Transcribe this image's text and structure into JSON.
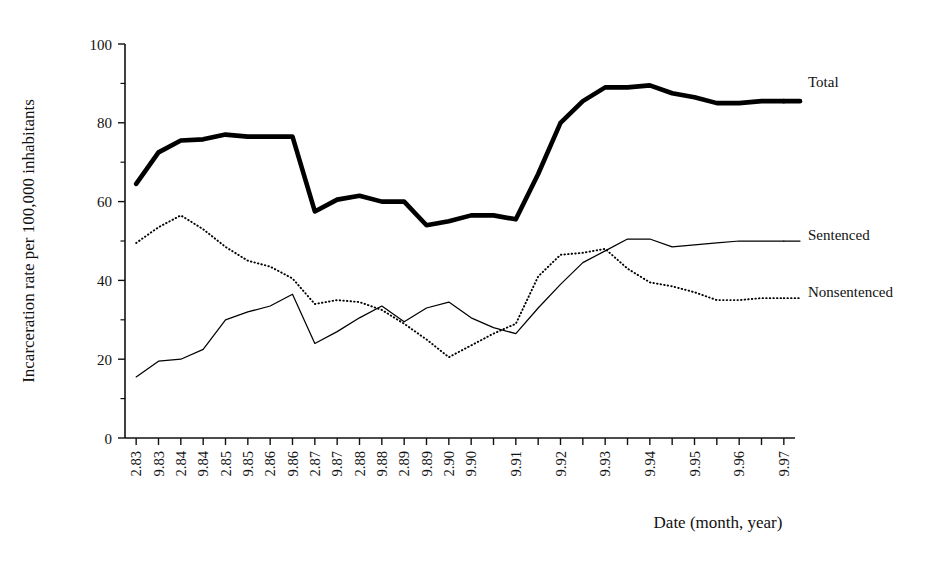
{
  "chart_data": {
    "type": "line",
    "title": "",
    "xlabel": "Date (month, year)",
    "ylabel": "Incarceration rate per 100,000 inhabitants",
    "ylim": [
      0,
      100
    ],
    "yticks": [
      0,
      20,
      40,
      60,
      80,
      100
    ],
    "yticks_minor": [
      10,
      30,
      50,
      70,
      90
    ],
    "grid": false,
    "legend_position": "right-inline",
    "categories": [
      "2.83",
      "9.83",
      "2.84",
      "9.84",
      "2.85",
      "9.85",
      "2.86",
      "9.86",
      "2.87",
      "9.87",
      "2.88",
      "9.88",
      "2.89",
      "9.89",
      "2.90",
      "9.90",
      "2.91",
      "9.91",
      "2.92",
      "9.92",
      "2.93",
      "9.93",
      "2.94",
      "9.94",
      "2.95",
      "9.95",
      "2.96",
      "9.96",
      "2.97",
      "9.97"
    ],
    "x_tick_labels": [
      "2.83",
      "9.83",
      "2.84",
      "9.84",
      "2.85",
      "9.85",
      "2.86",
      "9.86",
      "2.87",
      "9.87",
      "2.88",
      "9.88",
      "2.89",
      "9.89",
      "2.90",
      "9.90",
      "",
      "9.91",
      "",
      "9.92",
      "",
      "9.93",
      "",
      "9.94",
      "",
      "9.95",
      "",
      "9.96",
      "",
      "9.97"
    ],
    "series": [
      {
        "name": "Total",
        "style": "thick-solid",
        "color": "#000000",
        "values": [
          64.5,
          72.5,
          75.5,
          75.8,
          77.0,
          76.5,
          76.5,
          76.5,
          57.5,
          60.5,
          61.5,
          60.0,
          60.0,
          54.0,
          55.0,
          56.5,
          56.5,
          55.5,
          67.0,
          80.0,
          85.5,
          89.0,
          89.0,
          89.5,
          87.5,
          86.5,
          85.0,
          85.0,
          85.5,
          85.5
        ]
      },
      {
        "name": "Sentenced",
        "style": "thin-solid",
        "color": "#000000",
        "values": [
          15.5,
          19.5,
          20.0,
          22.5,
          30.0,
          32.0,
          33.5,
          36.5,
          24.0,
          27.0,
          30.5,
          33.5,
          29.5,
          33.0,
          34.5,
          30.5,
          28.0,
          26.5,
          33.0,
          39.0,
          44.5,
          47.5,
          50.5,
          50.5,
          48.5,
          49.0,
          49.5,
          50.0,
          50.0,
          50.0
        ]
      },
      {
        "name": "Nonsentenced",
        "style": "dotted",
        "color": "#000000",
        "values": [
          49.5,
          53.5,
          56.5,
          53.0,
          48.5,
          45.0,
          43.5,
          40.5,
          34.0,
          35.0,
          34.5,
          32.5,
          29.0,
          25.0,
          20.5,
          23.5,
          26.5,
          29.0,
          41.0,
          46.5,
          47.0,
          48.0,
          43.0,
          39.5,
          38.5,
          37.0,
          35.0,
          35.0,
          35.5,
          35.5
        ]
      }
    ],
    "series_labels": [
      {
        "name": "Total",
        "y_pos": 87
      },
      {
        "name": "Sentenced",
        "y_pos": 240
      },
      {
        "name": "Nonsentenced",
        "y_pos": 297
      }
    ]
  }
}
